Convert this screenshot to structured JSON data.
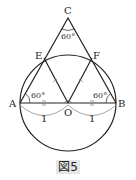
{
  "figure": {
    "caption": "図5",
    "points": {
      "A": {
        "label": "A",
        "x": 20,
        "y": 103
      },
      "B": {
        "label": "B",
        "x": 116,
        "y": 103
      },
      "C": {
        "label": "C",
        "x": 68,
        "y": 18
      },
      "E": {
        "label": "E",
        "x": 44,
        "y": 58
      },
      "F": {
        "label": "F",
        "x": 92,
        "y": 58
      },
      "O": {
        "label": "O",
        "x": 68,
        "y": 103
      }
    },
    "angles": {
      "C": "60°",
      "A": "60°",
      "B": "60°"
    },
    "lengths": {
      "AO": "1",
      "OB": "1"
    },
    "colors": {
      "line": "#222222",
      "dimension": "#9a9a9a",
      "caption_bg": "#e6e6e6"
    }
  }
}
